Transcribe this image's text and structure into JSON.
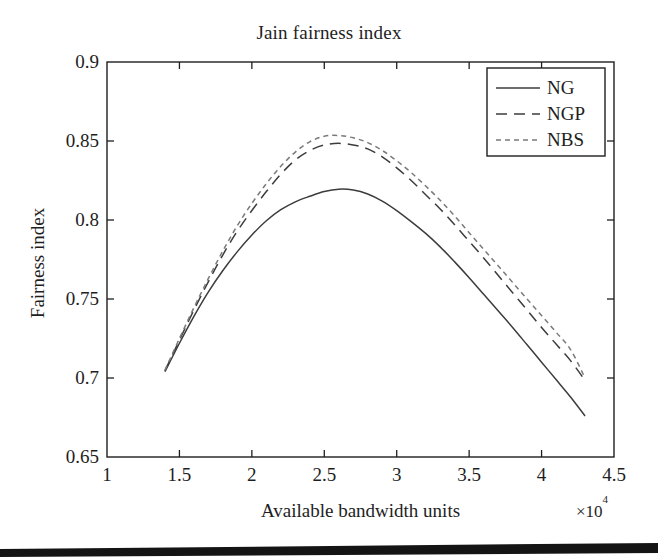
{
  "figure": {
    "title": "Jain fairness index",
    "background_color": "#ffffff",
    "axis_color": "#1e1e1e",
    "scan_bar_color": "#141414"
  },
  "axes": {
    "x_label": "Available bandwidth units",
    "x_exponent_prefix": "×10",
    "x_exponent_power": "4",
    "y_label": "Fairness index",
    "x_ticks": [
      "1",
      "1.5",
      "2",
      "2.5",
      "3",
      "3.5",
      "4",
      "4.5"
    ],
    "x_tick_values": [
      1,
      1.5,
      2,
      2.5,
      3,
      3.5,
      4,
      4.5
    ],
    "y_ticks": [
      "0.65",
      "0.7",
      "0.75",
      "0.8",
      "0.85",
      "0.9"
    ],
    "y_tick_values": [
      0.65,
      0.7,
      0.75,
      0.8,
      0.85,
      0.9
    ]
  },
  "legend": {
    "position": "top-right",
    "entries": [
      {
        "label": "NG",
        "style": "solid",
        "dash": "none"
      },
      {
        "label": "NGP",
        "style": "dashed",
        "dash": "11,7"
      },
      {
        "label": "NBS",
        "style": "short-dashed",
        "dash": "5,4"
      }
    ]
  },
  "chart_data": {
    "type": "line",
    "title": "Jain fairness index",
    "xlabel": "Available bandwidth units",
    "ylabel": "Fairness index",
    "x_scale_exponent": 4,
    "xlim": [
      1.0,
      4.5
    ],
    "ylim": [
      0.65,
      0.9
    ],
    "grid": false,
    "legend_position": "upper right",
    "x": [
      1.4,
      1.5,
      1.6,
      1.7,
      1.8,
      1.9,
      2.0,
      2.1,
      2.2,
      2.3,
      2.4,
      2.5,
      2.6,
      2.7,
      2.8,
      2.9,
      3.0,
      3.1,
      3.2,
      3.3,
      3.4,
      3.5,
      3.6,
      3.7,
      3.8,
      3.9,
      4.0,
      4.1,
      4.2,
      4.3
    ],
    "series": [
      {
        "name": "NG",
        "style": "solid",
        "color": "#3c3c3c",
        "values": [
          0.704,
          0.722,
          0.739,
          0.7545,
          0.768,
          0.78,
          0.7905,
          0.7995,
          0.8065,
          0.8115,
          0.815,
          0.818,
          0.8195,
          0.819,
          0.8165,
          0.812,
          0.806,
          0.799,
          0.7915,
          0.783,
          0.7735,
          0.7635,
          0.753,
          0.7425,
          0.732,
          0.721,
          0.71,
          0.699,
          0.688,
          0.676
        ]
      },
      {
        "name": "NGP",
        "style": "dashed",
        "color": "#3c3c3c",
        "values": [
          0.7045,
          0.724,
          0.743,
          0.761,
          0.778,
          0.793,
          0.806,
          0.818,
          0.829,
          0.838,
          0.844,
          0.8475,
          0.8485,
          0.8475,
          0.845,
          0.84,
          0.833,
          0.825,
          0.816,
          0.807,
          0.797,
          0.7865,
          0.776,
          0.765,
          0.754,
          0.743,
          0.732,
          0.7215,
          0.711,
          0.6985
        ]
      },
      {
        "name": "NBS",
        "style": "short-dashed",
        "color": "#7a7a7a",
        "values": [
          0.705,
          0.725,
          0.7445,
          0.763,
          0.7805,
          0.7965,
          0.8105,
          0.823,
          0.834,
          0.843,
          0.8495,
          0.853,
          0.8535,
          0.852,
          0.849,
          0.844,
          0.8375,
          0.83,
          0.8215,
          0.8125,
          0.8025,
          0.792,
          0.7815,
          0.771,
          0.7605,
          0.75,
          0.7395,
          0.729,
          0.718,
          0.7
        ]
      }
    ]
  }
}
